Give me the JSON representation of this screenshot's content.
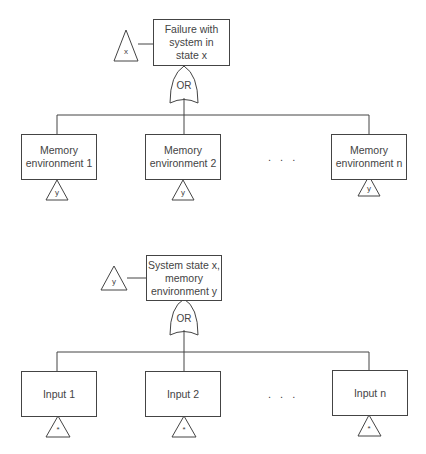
{
  "diagrams": [
    {
      "top_event": {
        "label": "Failure with system in state x",
        "lines": [
          "Failure with",
          "system in",
          "state x"
        ]
      },
      "transfer_in": "x",
      "gate": "OR",
      "children": [
        {
          "lines": [
            "Memory",
            "environment 1"
          ],
          "transfer": "y"
        },
        {
          "lines": [
            "Memory",
            "environment 2"
          ],
          "transfer": "y"
        },
        {
          "lines": [
            "Memory",
            "environment n"
          ],
          "transfer": "y"
        }
      ],
      "ellipsis": ". . ."
    },
    {
      "top_event": {
        "label": "System state x, memory environment y",
        "lines": [
          "System state x,",
          "memory",
          "environment y"
        ]
      },
      "transfer_in": "y",
      "gate": "OR",
      "children": [
        {
          "lines": [
            "Input 1"
          ],
          "transfer": "*"
        },
        {
          "lines": [
            "Input 2"
          ],
          "transfer": "*"
        },
        {
          "lines": [
            "Input n"
          ],
          "transfer": "*"
        }
      ],
      "ellipsis": ". . ."
    }
  ]
}
